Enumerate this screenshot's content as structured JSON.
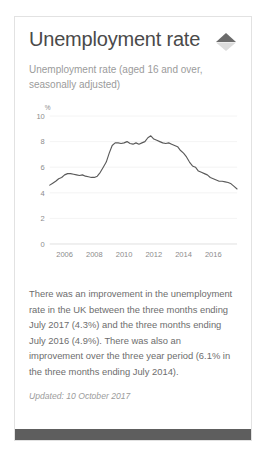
{
  "card": {
    "title": "Unemployment rate",
    "subtitle": "Unemployment rate (aged 16 and over, seasonally adjusted)",
    "collapse_icon": "collapse-chevron-diamond-icon",
    "body": "There was an improvement in the unemployment rate in the UK between the three months ending July 2017 (4.3%) and the three months ending July 2016 (4.9%). There was also an improvement over the three year period (6.1% in the three months ending July 2014).",
    "updated": "Updated: 10 October 2017",
    "colors": {
      "title": "#4a4a4a",
      "muted": "#9b9b9b",
      "body": "#6d6d6d",
      "line": "#5a5a5a",
      "border": "#e2e2e2",
      "footer": "#5e5e5e",
      "grid": "#efefef"
    }
  },
  "chart_data": {
    "type": "line",
    "title": "",
    "xlabel": "",
    "ylabel": "%",
    "ylim": [
      0,
      10
    ],
    "xlim": [
      2005.0,
      2017.6
    ],
    "yticks": [
      0,
      2,
      4,
      6,
      8,
      10
    ],
    "xticks": [
      2006,
      2008,
      2010,
      2012,
      2014,
      2016
    ],
    "grid": true,
    "legend": "none",
    "series": [
      {
        "name": "Unemployment rate",
        "x": [
          2005.0,
          2005.2,
          2005.4,
          2005.6,
          2005.8,
          2006.0,
          2006.2,
          2006.4,
          2006.6,
          2006.8,
          2007.0,
          2007.2,
          2007.4,
          2007.6,
          2007.8,
          2008.0,
          2008.2,
          2008.4,
          2008.6,
          2008.8,
          2009.0,
          2009.2,
          2009.4,
          2009.6,
          2009.8,
          2010.0,
          2010.2,
          2010.4,
          2010.6,
          2010.8,
          2011.0,
          2011.2,
          2011.4,
          2011.6,
          2011.8,
          2012.0,
          2012.2,
          2012.4,
          2012.6,
          2012.8,
          2013.0,
          2013.2,
          2013.4,
          2013.6,
          2013.8,
          2014.0,
          2014.2,
          2014.4,
          2014.6,
          2014.8,
          2015.0,
          2015.2,
          2015.4,
          2015.6,
          2015.8,
          2016.0,
          2016.2,
          2016.4,
          2016.6,
          2016.8,
          2017.0,
          2017.2,
          2017.4,
          2017.6
        ],
        "y": [
          4.6,
          4.75,
          4.9,
          5.1,
          5.2,
          5.4,
          5.5,
          5.5,
          5.45,
          5.4,
          5.35,
          5.4,
          5.3,
          5.25,
          5.2,
          5.2,
          5.3,
          5.6,
          6.0,
          6.4,
          7.1,
          7.7,
          7.9,
          7.9,
          7.85,
          7.9,
          8.0,
          7.85,
          7.8,
          7.9,
          7.8,
          7.9,
          8.0,
          8.3,
          8.45,
          8.2,
          8.1,
          8.0,
          7.9,
          7.85,
          7.9,
          7.8,
          7.7,
          7.6,
          7.3,
          7.1,
          6.8,
          6.4,
          6.1,
          6.0,
          5.7,
          5.6,
          5.5,
          5.4,
          5.2,
          5.1,
          5.0,
          4.9,
          4.9,
          4.85,
          4.8,
          4.7,
          4.5,
          4.3
        ],
        "color": "#5a5a5a"
      }
    ]
  }
}
